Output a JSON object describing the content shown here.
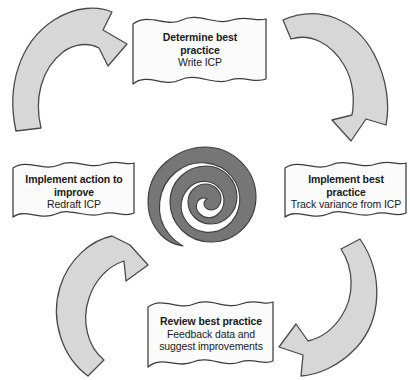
{
  "diagram": {
    "type": "cyclical-process-diagram",
    "title_visible": false,
    "direction": "clockwise",
    "colors": {
      "background": "#ffffff",
      "arrow_fill": "#d7d7d7",
      "arrow_stroke": "#4a4a4a",
      "banner_fill": "#fbfbfb",
      "banner_stroke": "#3c3c3c",
      "spiral_fill": "#767676",
      "spiral_stroke": "#3f3f3f",
      "text": "#1a1a1a"
    },
    "center": {
      "shape_name": "spiral-icon",
      "label": ""
    },
    "stages": [
      {
        "position": "top",
        "name": "determine-best-practice",
        "title": "Determine best practice",
        "title_line_1": "Determine best",
        "title_line_2": "practice",
        "subtitle": "Write ICP"
      },
      {
        "position": "right",
        "name": "implement-best-practice",
        "title": "Implement best practice",
        "title_line_1": "Implement best",
        "title_line_2": "practice",
        "subtitle": "Track variance from ICP"
      },
      {
        "position": "bottom",
        "name": "review-best-practice",
        "title": "Review best practice",
        "title_line_1": "Review best practice",
        "title_line_2": "",
        "subtitle_line_1": "Feedback data and",
        "subtitle_line_2": "suggest improvements"
      },
      {
        "position": "left",
        "name": "implement-action-to-improve",
        "title": "Implement action to improve",
        "title_line_1": "Implement action to",
        "title_line_2": "improve",
        "subtitle": "Redraft ICP"
      }
    ],
    "arrows": [
      {
        "name": "arrow-left-to-top",
        "position": "top-left",
        "points_to": "top",
        "direction": "clockwise"
      },
      {
        "name": "arrow-top-to-right",
        "position": "top-right",
        "points_to": "right",
        "direction": "clockwise"
      },
      {
        "name": "arrow-right-to-bottom",
        "position": "bottom-right",
        "points_to": "bottom",
        "direction": "clockwise"
      },
      {
        "name": "arrow-bottom-to-left",
        "position": "bottom-left",
        "points_to": "left",
        "direction": "clockwise"
      }
    ]
  }
}
